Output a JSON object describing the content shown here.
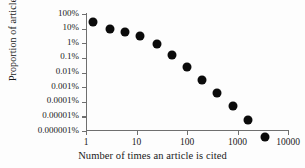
{
  "chart_data": {
    "type": "scatter",
    "title": "",
    "xlabel": "Number of times an article is cited",
    "ylabel": "Proportion of articles",
    "xscale": "log",
    "yscale": "log",
    "xlim": [
      1,
      10000
    ],
    "ylim": [
      1e-08,
      1
    ],
    "grid": false,
    "legend": null,
    "x_ticks": [
      {
        "value": 1,
        "label": "1"
      },
      {
        "value": 10,
        "label": "10"
      },
      {
        "value": 100,
        "label": "100"
      },
      {
        "value": 1000,
        "label": "1000"
      },
      {
        "value": 10000,
        "label": "10000"
      }
    ],
    "y_ticks": [
      {
        "value": 1,
        "label": "100%"
      },
      {
        "value": 0.1,
        "label": "10%"
      },
      {
        "value": 0.01,
        "label": "1%"
      },
      {
        "value": 0.001,
        "label": "0.1%"
      },
      {
        "value": 0.0001,
        "label": "0.01%"
      },
      {
        "value": 1e-05,
        "label": "0.001%"
      },
      {
        "value": 1e-06,
        "label": "0.0001%"
      },
      {
        "value": 1e-07,
        "label": "0.00001%"
      },
      {
        "value": 1e-08,
        "label": "0.000001%"
      }
    ],
    "marker": {
      "shape": "circle",
      "color": "#0b0b0b",
      "size_px": 9
    },
    "points": [
      {
        "x": 1.4,
        "y_percent": 30,
        "y": 0.3
      },
      {
        "x": 3,
        "y_percent": 9,
        "y": 0.09
      },
      {
        "x": 6,
        "y_percent": 6,
        "y": 0.06
      },
      {
        "x": 12,
        "y_percent": 3,
        "y": 0.03
      },
      {
        "x": 25,
        "y_percent": 0.9,
        "y": 0.009
      },
      {
        "x": 50,
        "y_percent": 0.15,
        "y": 0.0015
      },
      {
        "x": 100,
        "y_percent": 0.025,
        "y": 0.00025
      },
      {
        "x": 200,
        "y_percent": 0.003,
        "y": 3e-05
      },
      {
        "x": 400,
        "y_percent": 0.0004,
        "y": 4e-06
      },
      {
        "x": 800,
        "y_percent": 5e-05,
        "y": 5e-07
      },
      {
        "x": 1600,
        "y_percent": 6e-06,
        "y": 6e-08
      },
      {
        "x": 3500,
        "y_percent": 4e-07,
        "y": 4e-09
      }
    ]
  }
}
